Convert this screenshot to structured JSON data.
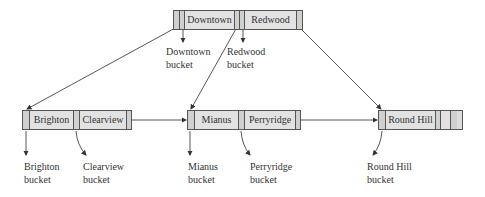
{
  "root": {
    "keys": [
      "Downtown",
      "Redwood"
    ]
  },
  "leaves": [
    {
      "keys": [
        "Brighton",
        "Clearview"
      ]
    },
    {
      "keys": [
        "Mianus",
        "Perryridge"
      ]
    },
    {
      "keys": [
        "Round Hill",
        "",
        ""
      ]
    }
  ],
  "buckets": [
    {
      "line1": "Downtown",
      "line2": "bucket"
    },
    {
      "line1": "Redwood",
      "line2": "bucket"
    },
    {
      "line1": "Brighton",
      "line2": "bucket"
    },
    {
      "line1": "Clearview",
      "line2": "bucket"
    },
    {
      "line1": "Mianus",
      "line2": "bucket"
    },
    {
      "line1": "Perryridge",
      "line2": "bucket"
    },
    {
      "line1": "Round Hill",
      "line2": "bucket"
    }
  ],
  "colors": {
    "node_fill": "#dcdcdc",
    "line": "#555555"
  }
}
